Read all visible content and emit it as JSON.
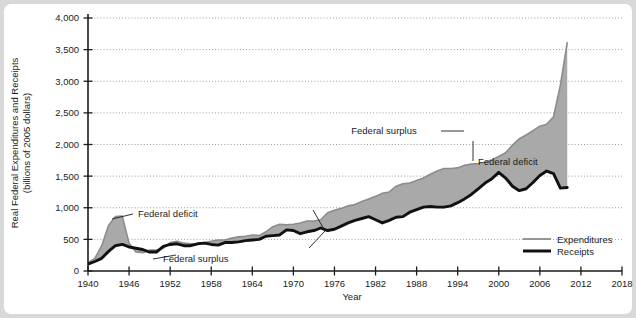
{
  "chart_data": {
    "type": "area",
    "title": "",
    "xlabel": "Year",
    "ylabel": "Real Federal Expenditures and Receipts (billions of 2005 dollars)",
    "ylabel_line1": "Real Federal Expenditures and Receipts",
    "ylabel_line2": "(billions of 2005 dollars)",
    "xlim": [
      1940,
      2018
    ],
    "ylim": [
      0,
      4000
    ],
    "grid": true,
    "legend_position": "bottom-right",
    "xticks": [
      1940,
      1946,
      1952,
      1958,
      1964,
      1970,
      1976,
      1982,
      1988,
      1994,
      2000,
      2006,
      2012,
      2018
    ],
    "xtick_labels": [
      "1940",
      "1946",
      "1952",
      "1958",
      "1964",
      "1970",
      "1976",
      "1982",
      "1988",
      "1994",
      "2000",
      "2006",
      "2012",
      "2018"
    ],
    "yticks": [
      0,
      500,
      1000,
      1500,
      2000,
      2500,
      3000,
      3500,
      4000
    ],
    "ytick_labels": [
      "0",
      "500",
      "1,000",
      "1,500",
      "2,000",
      "2,500",
      "3,000",
      "3,500",
      "4,000"
    ],
    "x": [
      1940,
      1941,
      1942,
      1943,
      1944,
      1945,
      1946,
      1947,
      1948,
      1949,
      1950,
      1951,
      1952,
      1953,
      1954,
      1955,
      1956,
      1957,
      1958,
      1959,
      1960,
      1961,
      1962,
      1963,
      1964,
      1965,
      1966,
      1967,
      1968,
      1969,
      1970,
      1971,
      1972,
      1973,
      1974,
      1975,
      1976,
      1977,
      1978,
      1979,
      1980,
      1981,
      1982,
      1983,
      1984,
      1985,
      1986,
      1987,
      1988,
      1989,
      1990,
      1991,
      1992,
      1993,
      1994,
      1995,
      1996,
      1997,
      1998,
      1999,
      2000,
      2001,
      2002,
      2003,
      2004,
      2005,
      2006,
      2007,
      2008,
      2009,
      2010
    ],
    "series": [
      {
        "name": "Expenditures",
        "values": [
          130,
          200,
          400,
          720,
          860,
          870,
          440,
          300,
          290,
          330,
          330,
          360,
          450,
          470,
          440,
          430,
          430,
          450,
          470,
          490,
          490,
          520,
          540,
          550,
          570,
          560,
          620,
          700,
          740,
          730,
          740,
          760,
          790,
          790,
          810,
          920,
          960,
          990,
          1030,
          1050,
          1100,
          1140,
          1180,
          1230,
          1250,
          1340,
          1380,
          1390,
          1430,
          1470,
          1530,
          1580,
          1620,
          1620,
          1630,
          1670,
          1690,
          1700,
          1720,
          1760,
          1810,
          1870,
          1990,
          2090,
          2150,
          2220,
          2290,
          2320,
          2440,
          2940,
          3610
        ]
      },
      {
        "name": "Receipts",
        "values": [
          110,
          150,
          200,
          310,
          400,
          420,
          380,
          360,
          340,
          300,
          300,
          390,
          420,
          430,
          400,
          400,
          430,
          440,
          420,
          410,
          450,
          450,
          460,
          480,
          490,
          500,
          550,
          560,
          570,
          650,
          640,
          590,
          620,
          640,
          680,
          640,
          660,
          710,
          760,
          800,
          830,
          860,
          810,
          760,
          800,
          850,
          860,
          930,
          970,
          1010,
          1020,
          1010,
          1010,
          1030,
          1080,
          1140,
          1210,
          1300,
          1390,
          1460,
          1560,
          1470,
          1340,
          1270,
          1300,
          1400,
          1510,
          1580,
          1540,
          1310,
          1320
        ]
      }
    ],
    "annotations": [
      {
        "label": "Federal deficit",
        "id": "federal-deficit-1940s"
      },
      {
        "label": "Federal surplus",
        "id": "federal-surplus-1950s"
      },
      {
        "label": "Federal surplus",
        "id": "federal-surplus-2000"
      },
      {
        "label": "Federal deficit",
        "id": "federal-deficit-2000s"
      }
    ],
    "legend": [
      {
        "label": "Expenditures",
        "style": "thin-gray-line",
        "color": "#8c8c8c"
      },
      {
        "label": "Receipts",
        "style": "thick-black-line",
        "color": "#111111"
      }
    ],
    "colors": {
      "fill": "#a9a9a9",
      "expenditures": "#8c8c8c",
      "receipts": "#111111",
      "axis": "#1b1b1b",
      "grid": "#9a9a9a",
      "page_background": "#d9d9d9",
      "card_background": "#ffffff"
    }
  }
}
